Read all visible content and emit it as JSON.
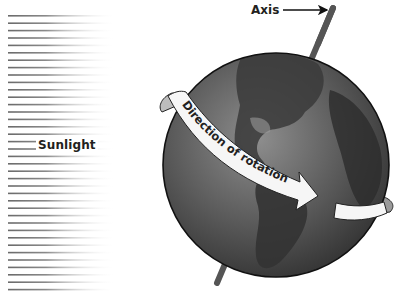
{
  "diagram": {
    "labels": {
      "sunlight": "Sunlight",
      "axis": "Axis",
      "rotation": "Direction of rotation"
    },
    "elements": {
      "sunlight_rays": {
        "count": 38,
        "icon": "sun-rays",
        "color": "#7a7a7a"
      },
      "globe": {
        "icon": "earth-globe",
        "color": "#4a4a4a"
      },
      "axis_rod": {
        "icon": "tilted-axis",
        "color": "#5c5c5c"
      },
      "rotation_band": {
        "icon": "curved-arrow-band",
        "color": "#f4f4f4"
      }
    }
  }
}
